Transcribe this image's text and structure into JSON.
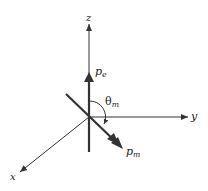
{
  "diagram": {
    "type": "3D coordinate axes with dipole vectors",
    "axes": {
      "z": {
        "label": "z"
      },
      "y": {
        "label": "y"
      },
      "x": {
        "label": "x"
      }
    },
    "vectors": {
      "electric_dipole": {
        "symbol": "p",
        "subscript": "e",
        "direction": "+z"
      },
      "magnetic_dipole": {
        "symbol": "p",
        "subscript": "m",
        "direction": "in x-z-ish plane, tilted from z by theta_m"
      }
    },
    "angle": {
      "symbol": "θ",
      "subscript": "m",
      "between": [
        "p_e",
        "p_m"
      ]
    },
    "colors": {
      "axis": "#333333",
      "vector": "#333333",
      "text": "#222222",
      "background": "#ffffff"
    }
  }
}
